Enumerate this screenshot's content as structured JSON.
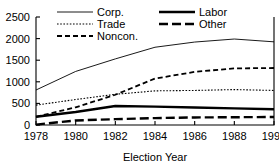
{
  "chart_data": {
    "type": "line",
    "title": "",
    "xlabel": "Election Year",
    "ylabel": "",
    "x": [
      1978,
      1980,
      1982,
      1984,
      1986,
      1988,
      1990
    ],
    "xlim": [
      1978,
      1990
    ],
    "ylim": [
      0,
      2500
    ],
    "xticks": [
      "1978",
      "1980",
      "1982",
      "1984",
      "1986",
      "1988",
      "1990"
    ],
    "yticks": [
      "0",
      "500",
      "1000",
      "1500",
      "2000",
      "2500"
    ],
    "grid": false,
    "legend_position": "top",
    "series": [
      {
        "name": "Corp.",
        "style": "thin-solid",
        "values": [
          810,
          1240,
          1530,
          1800,
          1920,
          1990,
          1925
        ]
      },
      {
        "name": "Trade",
        "style": "fine-dotted",
        "values": [
          460,
          590,
          710,
          790,
          800,
          820,
          800
        ]
      },
      {
        "name": "Noncon.",
        "style": "medium-dashed",
        "values": [
          190,
          410,
          700,
          1075,
          1230,
          1310,
          1320
        ]
      },
      {
        "name": "Labor",
        "style": "thick-solid",
        "values": [
          190,
          300,
          440,
          425,
          405,
          385,
          365
        ]
      },
      {
        "name": "Other",
        "style": "thick-long-dashed",
        "values": [
          10,
          105,
          135,
          160,
          175,
          180,
          185
        ]
      }
    ]
  },
  "legend": {
    "entries": [
      {
        "label": "Corp."
      },
      {
        "label": "Trade"
      },
      {
        "label": "Noncon."
      },
      {
        "label": "Labor"
      },
      {
        "label": "Other"
      }
    ]
  },
  "colors": {
    "ink": "#000000",
    "background": "#ffffff"
  }
}
